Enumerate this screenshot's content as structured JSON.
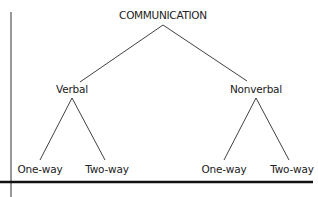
{
  "diagram": {
    "root": {
      "label": "COMMUNICATION"
    },
    "branches": [
      {
        "label": "Verbal",
        "children": [
          {
            "label": "One-way"
          },
          {
            "label": "Two-way"
          }
        ]
      },
      {
        "label": "Nonverbal",
        "children": [
          {
            "label": "One-way"
          },
          {
            "label": "Two-way"
          }
        ]
      }
    ]
  },
  "colors": {
    "line": "#2a2a2a",
    "text": "#222222",
    "background": "#ffffff"
  }
}
